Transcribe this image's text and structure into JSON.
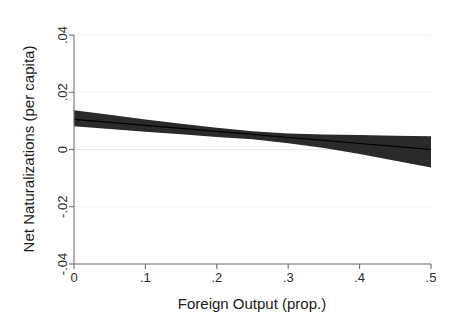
{
  "figure": {
    "background_color": "#ffffff",
    "plot_area": {
      "left_px": 74,
      "right_px": 431,
      "top_px": 35,
      "bottom_px": 264
    }
  },
  "chart_data": {
    "type": "line",
    "title": "",
    "subtitle": "",
    "xlabel": "Foreign Output (prop.)",
    "ylabel": "Net Naturalizations (per capita)",
    "xlim": [
      0,
      0.5
    ],
    "ylim": [
      -0.04,
      0.04
    ],
    "xticks": [
      0,
      0.1,
      0.2,
      0.3,
      0.4,
      0.5
    ],
    "xtick_labels": [
      "0",
      ".1",
      ".2",
      ".3",
      ".4",
      ".5"
    ],
    "yticks": [
      0.04,
      0.02,
      0,
      -0.02,
      -0.04
    ],
    "ytick_labels": [
      ".04",
      ".02",
      "0",
      "-.02",
      "-.04"
    ],
    "grid": "horizontal-faint",
    "legend": "none",
    "legend_position": "none",
    "annotations": [],
    "colors": {
      "band": "#2a2a2a",
      "line": "#000000",
      "axis": "#6f6f6f",
      "grid": "#f2f2f2",
      "text": "#1a1a1a"
    },
    "series": [
      {
        "name": "Predicted margin",
        "kind": "fit-line",
        "x": [
          0,
          0.05,
          0.1,
          0.15,
          0.2,
          0.25,
          0.3,
          0.35,
          0.4,
          0.45,
          0.5
        ],
        "values": [
          0.0105,
          0.0095,
          0.0084,
          0.0074,
          0.0063,
          0.0053,
          0.0042,
          0.0032,
          0.0021,
          0.0011,
          0.0
        ]
      },
      {
        "name": "95% confidence interval (upper)",
        "kind": "ci-upper",
        "x": [
          0,
          0.05,
          0.1,
          0.15,
          0.2,
          0.25,
          0.3,
          0.35,
          0.4,
          0.45,
          0.5
        ],
        "values": [
          0.0137,
          0.0121,
          0.0105,
          0.009,
          0.0076,
          0.0064,
          0.0056,
          0.0052,
          0.0051,
          0.0048,
          0.0046
        ]
      },
      {
        "name": "95% confidence interval (lower)",
        "kind": "ci-lower",
        "x": [
          0,
          0.05,
          0.1,
          0.15,
          0.2,
          0.25,
          0.3,
          0.35,
          0.4,
          0.45,
          0.5
        ],
        "values": [
          0.0081,
          0.0072,
          0.0062,
          0.0053,
          0.0044,
          0.0036,
          0.0022,
          0.0005,
          -0.0016,
          -0.0039,
          -0.0063
        ]
      }
    ]
  }
}
